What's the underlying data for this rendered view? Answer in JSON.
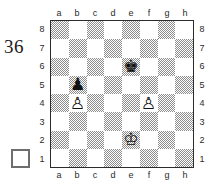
{
  "diagram": {
    "number": "36",
    "side_to_move_indicator": "white-empty-square"
  },
  "board": {
    "files_top": [
      "a",
      "b",
      "c",
      "d",
      "e",
      "f",
      "g",
      "h"
    ],
    "files_bottom": [
      "a",
      "b",
      "c",
      "d",
      "e",
      "f",
      "g",
      "h"
    ],
    "ranks_left": [
      "8",
      "7",
      "6",
      "5",
      "4",
      "3",
      "2",
      "1"
    ],
    "ranks_right": [
      "8",
      "7",
      "6",
      "5",
      "4",
      "3",
      "2",
      "1"
    ],
    "light_square_color": "#ffffff",
    "dark_square_color": "#8c8c8c",
    "border_color": "#2b2b2b"
  },
  "chart_data": {
    "type": "table",
    "orientation": "white-at-bottom",
    "side_to_move": "white",
    "pieces": [
      {
        "square": "e6",
        "piece": "king",
        "color": "black",
        "glyph": "♚"
      },
      {
        "square": "b5",
        "piece": "pawn",
        "color": "black",
        "glyph": "♟"
      },
      {
        "square": "b4",
        "piece": "pawn",
        "color": "white",
        "glyph": "♙"
      },
      {
        "square": "f4",
        "piece": "pawn",
        "color": "white",
        "glyph": "♙"
      },
      {
        "square": "e2",
        "piece": "king",
        "color": "white",
        "glyph": "♔"
      }
    ],
    "fen": "8/8/4k3/1p6/1P3P2/8/4K3/8 w - - 0 1",
    "material": {
      "white": [
        "Ke2",
        "Pb4",
        "Pf4"
      ],
      "black": [
        "Ke6",
        "Pb5"
      ]
    }
  }
}
